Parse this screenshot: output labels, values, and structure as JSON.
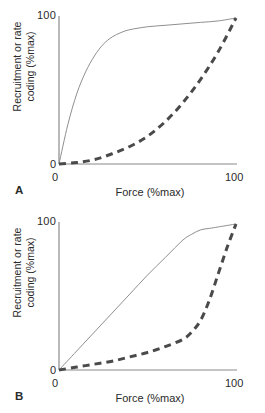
{
  "figure": {
    "background_color": "#ffffff",
    "panels": [
      {
        "id": "A",
        "letter": "A",
        "axes": {
          "xlabel": "Force (%max)",
          "ylabel": "Recruitment or rate\ncoding (%max)",
          "x_ticks": [
            "0",
            "100"
          ],
          "y_ticks": [
            "0",
            "100"
          ],
          "xlim": [
            0,
            100
          ],
          "ylim": [
            0,
            100
          ],
          "grid": false,
          "axis_color": "#8a8a8a"
        }
      },
      {
        "id": "B",
        "letter": "B",
        "axes": {
          "xlabel": "Force (%max)",
          "ylabel": "Recruitment or rate\ncoding (%max)",
          "x_ticks": [
            "0",
            "100"
          ],
          "y_ticks": [
            "0",
            "100"
          ],
          "xlim": [
            0,
            100
          ],
          "ylim": [
            0,
            100
          ],
          "grid": false,
          "axis_color": "#8a8a8a"
        }
      }
    ],
    "style": {
      "solid_line_color": "#8f8f8f",
      "solid_line_width": 1,
      "dashed_line_color": "#4a4a4a",
      "dashed_line_width": 3,
      "dash_pattern": "7 5"
    }
  },
  "chart_data": [
    {
      "type": "line",
      "title": "",
      "panel": "A",
      "xlabel": "Force (%max)",
      "ylabel": "Recruitment or rate coding (%max)",
      "xlim": [
        0,
        100
      ],
      "ylim": [
        0,
        100
      ],
      "grid": false,
      "legend": "none",
      "series": [
        {
          "name": "recruitment (solid)",
          "style": "solid",
          "color": "#8f8f8f",
          "x": [
            0,
            5,
            10,
            15,
            20,
            25,
            30,
            35,
            40,
            50,
            60,
            70,
            80,
            90,
            100
          ],
          "y": [
            0,
            27,
            48,
            63,
            74,
            82,
            87,
            90,
            92,
            94,
            95,
            96,
            97,
            98,
            100
          ]
        },
        {
          "name": "rate coding (dashed)",
          "style": "dashed",
          "color": "#4a4a4a",
          "x": [
            0,
            10,
            20,
            30,
            40,
            50,
            60,
            70,
            80,
            90,
            100
          ],
          "y": [
            0,
            1,
            3,
            7,
            12,
            19,
            29,
            42,
            58,
            77,
            100
          ]
        }
      ]
    },
    {
      "type": "line",
      "title": "",
      "panel": "B",
      "xlabel": "Force (%max)",
      "ylabel": "Recruitment or rate coding (%max)",
      "xlim": [
        0,
        100
      ],
      "ylim": [
        0,
        100
      ],
      "grid": false,
      "legend": "none",
      "series": [
        {
          "name": "recruitment (solid)",
          "style": "solid",
          "color": "#8f8f8f",
          "x": [
            0,
            10,
            20,
            30,
            40,
            50,
            60,
            70,
            75,
            80,
            85,
            90,
            100
          ],
          "y": [
            0,
            13,
            26,
            39,
            52,
            65,
            77,
            89,
            93,
            96,
            97,
            98,
            100
          ]
        },
        {
          "name": "rate coding (dashed)",
          "style": "dashed",
          "color": "#4a4a4a",
          "x": [
            0,
            10,
            20,
            30,
            40,
            50,
            60,
            70,
            75,
            80,
            85,
            90,
            95,
            100
          ],
          "y": [
            0,
            2,
            4,
            6,
            9,
            12,
            16,
            21,
            26,
            34,
            48,
            66,
            84,
            100
          ]
        }
      ]
    }
  ]
}
